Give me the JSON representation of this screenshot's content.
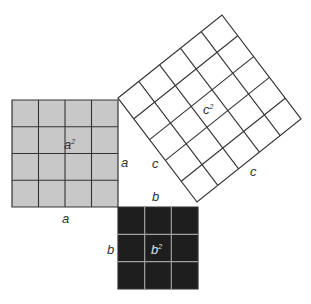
{
  "diagram": {
    "squares": [
      {
        "id": "a",
        "grid": 4,
        "area_label": "a",
        "area_exp": "2",
        "fill": "#c8c8c8",
        "line": "#333333"
      },
      {
        "id": "b",
        "grid": 3,
        "area_label": "b",
        "area_exp": "2",
        "fill": "#1e1e1e",
        "line": "#a0a0a0"
      },
      {
        "id": "c",
        "grid": 5,
        "area_label": "c",
        "area_exp": "2",
        "fill": "#ffffff",
        "line": "#333333"
      }
    ],
    "side_labels": {
      "a_bottom": "a",
      "a_right": "a",
      "b_top": "b",
      "b_left": "b",
      "c_lower_left": "c",
      "c_lower_right": "c"
    }
  }
}
